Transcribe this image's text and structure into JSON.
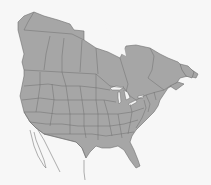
{
  "map": {
    "title": "",
    "region": "North America",
    "countries_shown": [
      "Canada",
      "United States",
      "Mexico (northern, outline)"
    ],
    "style": {
      "background": "#f7f7f7",
      "land_fill": "#a6a6a6",
      "border_color": "#6e6e6e",
      "lake_fill": "#f4f4f4"
    },
    "labels": []
  }
}
